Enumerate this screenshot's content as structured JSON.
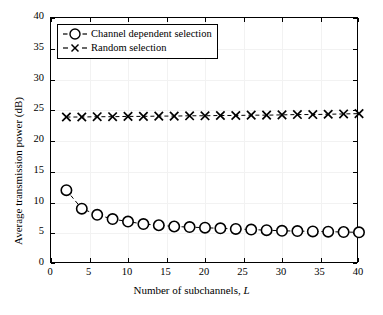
{
  "chart_data": {
    "type": "line",
    "title": "",
    "xlabel": "Number of subchannels, L",
    "ylabel": "Average transmission power (dB)",
    "xlim": [
      0,
      40
    ],
    "ylim": [
      0,
      40
    ],
    "xticks": [
      0,
      5,
      10,
      15,
      20,
      25,
      30,
      35,
      40
    ],
    "yticks": [
      0,
      5,
      10,
      15,
      20,
      25,
      30,
      35,
      40
    ],
    "grid": true,
    "legend_position": "upper left",
    "x": [
      2,
      4,
      6,
      8,
      10,
      12,
      14,
      16,
      18,
      20,
      22,
      24,
      26,
      28,
      30,
      32,
      34,
      36,
      38,
      40
    ],
    "series": [
      {
        "name": "Channel dependent selection",
        "marker": "circle",
        "linestyle": "dashed",
        "color": "#000000",
        "values": [
          12.0,
          9.0,
          8.0,
          7.3,
          6.9,
          6.5,
          6.3,
          6.1,
          6.0,
          5.9,
          5.8,
          5.7,
          5.6,
          5.5,
          5.4,
          5.35,
          5.3,
          5.25,
          5.2,
          5.15
        ]
      },
      {
        "name": "Random selection",
        "marker": "x",
        "linestyle": "dashed",
        "color": "#000000",
        "values": [
          23.9,
          23.9,
          23.95,
          23.95,
          24.0,
          24.0,
          24.05,
          24.05,
          24.1,
          24.1,
          24.15,
          24.15,
          24.2,
          24.2,
          24.25,
          24.3,
          24.3,
          24.35,
          24.4,
          24.45
        ]
      }
    ]
  },
  "axis": {
    "x_title_main": "Number of subchannels,",
    "x_title_italic": "L",
    "y_title": "Average transmission power (dB)"
  },
  "legend": {
    "items": [
      {
        "label": "Channel dependent selection",
        "marker": "circle-marker"
      },
      {
        "label": "Random selection",
        "marker": "x-marker"
      }
    ]
  }
}
